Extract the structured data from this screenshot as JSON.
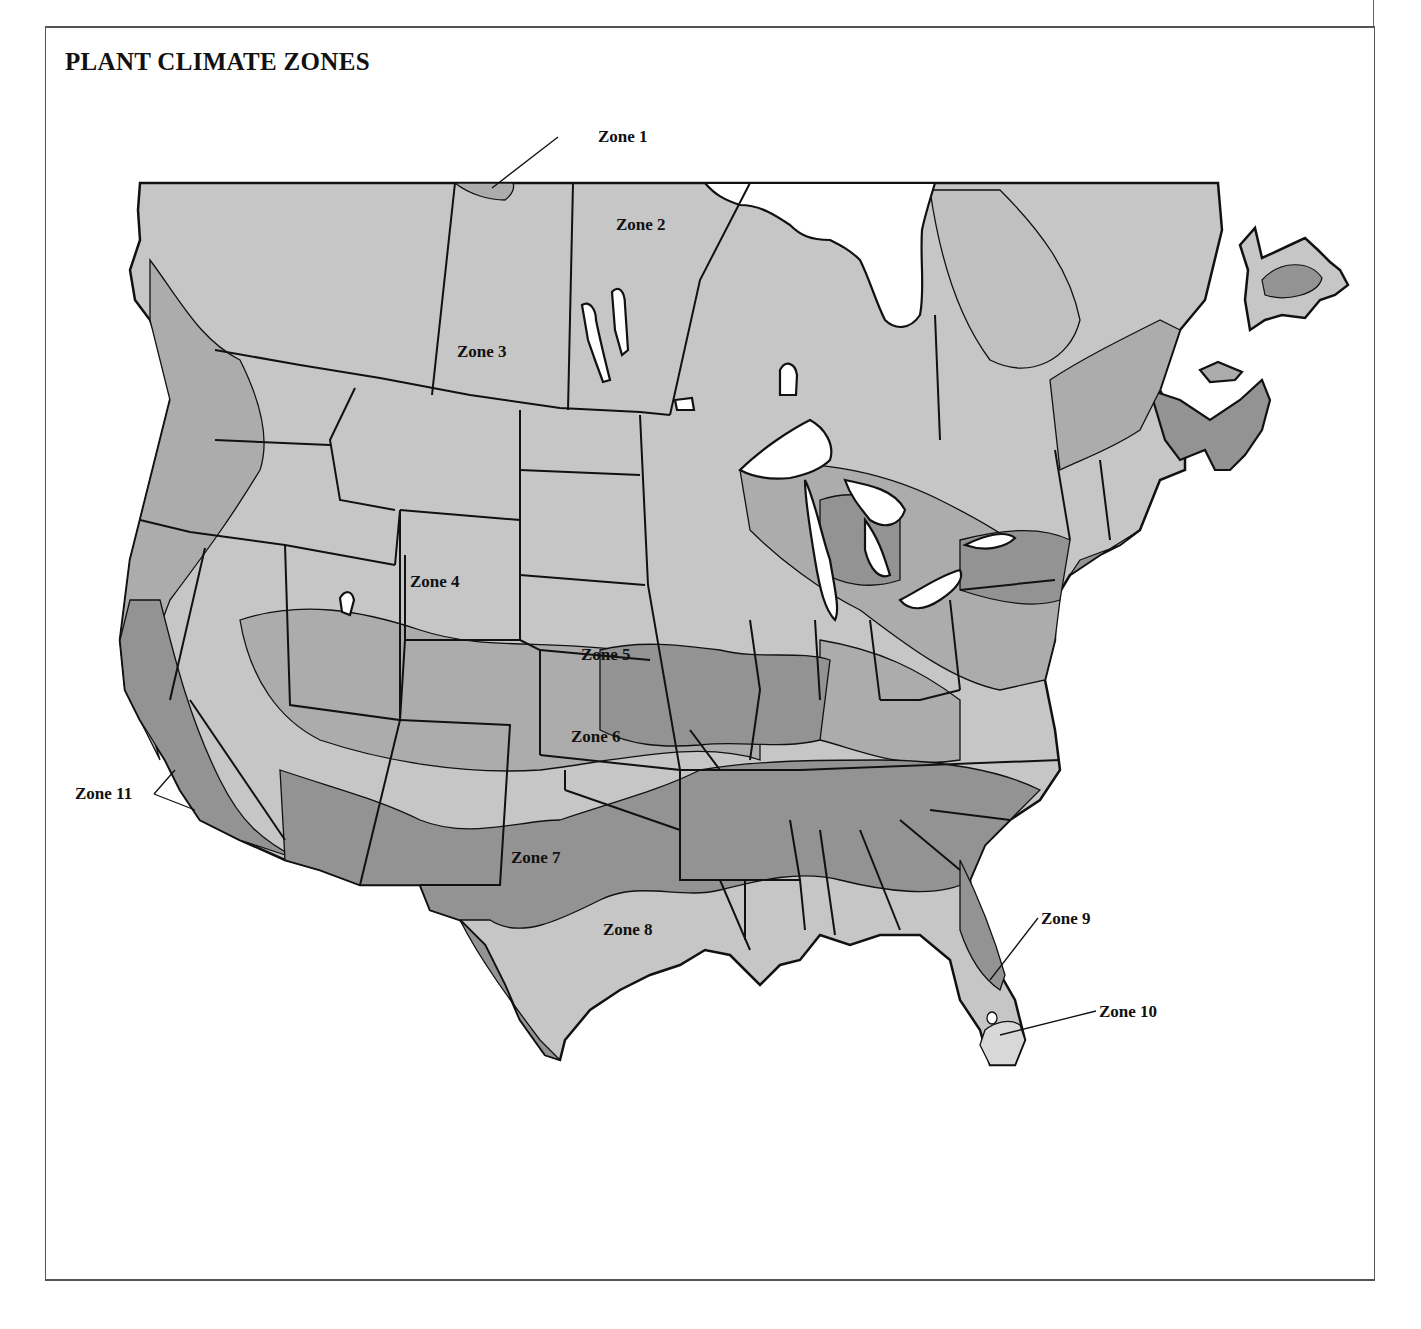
{
  "title": "PLANT CLIMATE ZONES",
  "colors": {
    "zone_light": "#c6c6c6",
    "zone_mid": "#acacac",
    "zone_dark": "#939393",
    "zone_pale": "#d8d8d8",
    "water": "#ffffff",
    "border": "#111111"
  },
  "zones": [
    {
      "id": 1,
      "label": "Zone 1",
      "x": 598,
      "y": 142
    },
    {
      "id": 2,
      "label": "Zone 2",
      "x": 616,
      "y": 230
    },
    {
      "id": 3,
      "label": "Zone 3",
      "x": 457,
      "y": 357
    },
    {
      "id": 4,
      "label": "Zone 4",
      "x": 410,
      "y": 587
    },
    {
      "id": 5,
      "label": "Zone 5",
      "x": 581,
      "y": 660
    },
    {
      "id": 6,
      "label": "Zone 6",
      "x": 571,
      "y": 742
    },
    {
      "id": 7,
      "label": "Zone 7",
      "x": 511,
      "y": 863
    },
    {
      "id": 8,
      "label": "Zone 8",
      "x": 603,
      "y": 935
    },
    {
      "id": 9,
      "label": "Zone 9",
      "x": 1041,
      "y": 924
    },
    {
      "id": 10,
      "label": "Zone 10",
      "x": 1099,
      "y": 1017
    },
    {
      "id": 11,
      "label": "Zone 11",
      "x": 75,
      "y": 799
    }
  ]
}
